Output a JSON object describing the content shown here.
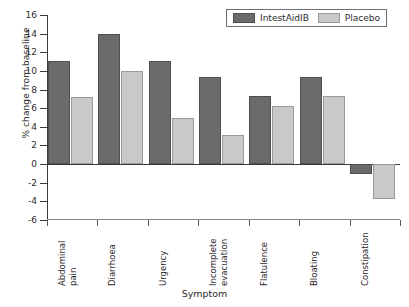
{
  "chart_data": {
    "type": "bar",
    "title": "",
    "xlabel": "Symptom",
    "ylabel": "% change from baseline",
    "ylim": [
      -6,
      16
    ],
    "yticks": [
      16,
      14,
      12,
      10,
      8,
      6,
      4,
      2,
      0,
      -2,
      -4,
      -6
    ],
    "ytick_labels": [
      "16",
      "14",
      "12",
      "10",
      "8",
      "6",
      "4",
      "2",
      "0",
      "-2",
      "-4",
      "-6"
    ],
    "grid": false,
    "legend_position": "top-right",
    "categories": [
      "Abdominal pain",
      "Diarrhoea",
      "Urgency",
      "Incomplete evacuation",
      "Flatulence",
      "Bloating",
      "Constipation"
    ],
    "category_lines": [
      [
        "Abdominal",
        "pain"
      ],
      [
        "Diarrhoea"
      ],
      [
        "Urgency"
      ],
      [
        "Incomplete",
        "evacuation"
      ],
      [
        "Flatulence"
      ],
      [
        "Bloating"
      ],
      [
        "Constipation"
      ]
    ],
    "series": [
      {
        "name": "IntestAidIB",
        "color": "#6b6b6b",
        "values": [
          11.1,
          14.0,
          11.1,
          9.3,
          7.3,
          9.4,
          -1.1
        ]
      },
      {
        "name": "Placebo",
        "color": "#c9c9c9",
        "values": [
          7.2,
          10.0,
          4.9,
          3.1,
          6.2,
          7.3,
          -3.8
        ]
      }
    ]
  },
  "legend": {
    "items": [
      {
        "label": "IntestAidIB",
        "series": "treat"
      },
      {
        "label": "Placebo",
        "series": "plac"
      }
    ]
  }
}
